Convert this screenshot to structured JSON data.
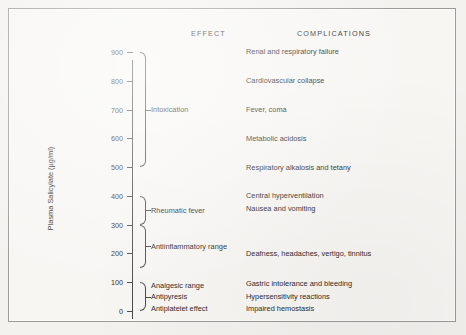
{
  "figure": {
    "headers": {
      "effect": "EFFECT",
      "complications": "COMPLICATIONS"
    },
    "y_axis_label": "Plasma Salicylate (µg/ml)"
  },
  "chart_data": {
    "type": "table",
    "title": "",
    "subtitle": "",
    "xlabel": "",
    "ylabel": "Plasma Salicylate (µg/ml)",
    "ylim": [
      0,
      900
    ],
    "ytick_labels": [
      "900",
      "800",
      "700",
      "600",
      "500",
      "400",
      "300",
      "200",
      "100",
      "0"
    ],
    "ytick_values": [
      900,
      800,
      700,
      600,
      500,
      400,
      300,
      200,
      100,
      0
    ],
    "grid": false,
    "legend": "none",
    "columns": [
      "EFFECT",
      "COMPLICATIONS"
    ],
    "effects": [
      {
        "label": "Intoxication",
        "range": [
          500,
          900
        ]
      },
      {
        "label": "Rheumatic fever",
        "range": [
          300,
          400
        ]
      },
      {
        "label": "Antiinflammatory range",
        "range": [
          150,
          300
        ]
      },
      {
        "label": "Analgesic range",
        "range": [
          0,
          100
        ]
      },
      {
        "label": "Antipyresis",
        "range": [
          0,
          100
        ]
      },
      {
        "label": "Antiplatelet effect",
        "range": [
          0,
          100
        ]
      }
    ],
    "complications": [
      {
        "label": "Renal and respiratory failure",
        "level": 900
      },
      {
        "label": "Cardiovascular collapse",
        "level": 800
      },
      {
        "label": "Fever, coma",
        "level": 700
      },
      {
        "label": "Metabolic acidosis",
        "level": 600
      },
      {
        "label": "Respiratory alkalosis and tetany",
        "level": 500
      },
      {
        "label": "Central hyperventilation",
        "level": 400
      },
      {
        "label": "Nausea and vomiting",
        "level": 355
      },
      {
        "label": "Deafness, headaches, vertigo, tinnitus",
        "level": 200
      },
      {
        "label": "Gastric intolerance and bleeding",
        "level": 95
      },
      {
        "label": "Hypersensitivity reactions",
        "level": 50
      },
      {
        "label": "Impaired hemostasis",
        "level": 10
      }
    ]
  }
}
